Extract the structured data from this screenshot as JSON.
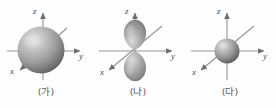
{
  "figure": {
    "title": "",
    "background_color": "#fefefe",
    "panels": [
      {
        "id": "panel-a",
        "caption": "(가)",
        "orbital_shape": "sphere",
        "orbital_size": "large",
        "axes": {
          "z_label": "z",
          "y_label": "y",
          "x_label": "x"
        },
        "colors": {
          "orbital_light": "#d8d8d8",
          "orbital_mid": "#9a9a9a",
          "orbital_dark": "#6a6a6a",
          "axis": "#8c8c8c",
          "label": "#4c4c4c"
        }
      },
      {
        "id": "panel-b",
        "caption": "(나)",
        "orbital_shape": "dumbbell",
        "orbital_size": "medium",
        "axes": {
          "z_label": "z",
          "y_label": "y",
          "x_label": "x"
        },
        "colors": {
          "orbital_light": "#d8d8d8",
          "orbital_mid": "#9a9a9a",
          "orbital_dark": "#6a6a6a",
          "axis": "#8c8c8c",
          "label": "#4c4c4c"
        }
      },
      {
        "id": "panel-c",
        "caption": "(다)",
        "orbital_shape": "sphere",
        "orbital_size": "small",
        "axes": {
          "z_label": "z",
          "y_label": "y",
          "x_label": "x"
        },
        "colors": {
          "orbital_light": "#d8d8d8",
          "orbital_mid": "#9a9a9a",
          "orbital_dark": "#6a6a6a",
          "axis": "#8c8c8c",
          "label": "#4c4c4c"
        }
      }
    ]
  }
}
